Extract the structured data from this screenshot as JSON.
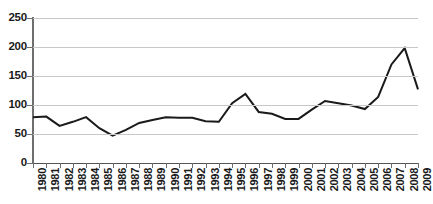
{
  "chart_data": {
    "type": "line",
    "title": "",
    "subtitle": "",
    "xlabel": "",
    "ylabel": "",
    "grid": true,
    "legend": false,
    "legend_position": "none",
    "line_color": "#1a1a1a",
    "gridline_color": "#c8c8c8",
    "axis_color": "#6e6e6e",
    "background_color": "#ffffff",
    "ylim": [
      0,
      250
    ],
    "y_ticks": [
      0,
      50,
      100,
      150,
      200,
      250
    ],
    "y_tick_labels": [
      "0",
      "50",
      "100",
      "150",
      "200",
      "250"
    ],
    "categories": [
      "1980",
      "1981",
      "1982",
      "1983",
      "1984",
      "1985",
      "1986",
      "1987",
      "1988",
      "1989",
      "1990",
      "1991",
      "1992",
      "1993",
      "1994",
      "1995",
      "1996",
      "1997",
      "1998",
      "1999",
      "2000",
      "2001",
      "2002",
      "2003",
      "2004",
      "2005",
      "2006",
      "2007",
      "2008",
      "2009"
    ],
    "values": [
      79,
      80,
      64,
      71,
      79,
      60,
      47,
      57,
      69,
      74,
      79,
      78,
      78,
      72,
      71,
      103,
      119,
      88,
      85,
      76,
      76,
      92,
      107,
      103,
      99,
      93,
      114,
      170,
      198,
      127
    ]
  }
}
